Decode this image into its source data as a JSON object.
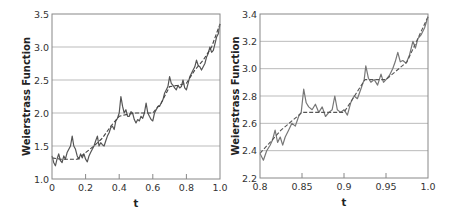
{
  "chart_data": [
    {
      "type": "line",
      "title": "",
      "xlabel": "t",
      "ylabel": "Weierstrass Function",
      "xlim": [
        0,
        1.0
      ],
      "ylim": [
        1.0,
        3.5
      ],
      "xticks": [
        0,
        0.2,
        0.4,
        0.6,
        0.8,
        1.0
      ],
      "xtick_labels": [
        "0",
        "0.2",
        "0.4",
        "0.6",
        "0.8",
        "1.0"
      ],
      "yticks": [
        1.0,
        1.5,
        2.0,
        2.5,
        3.0,
        3.5
      ],
      "ytick_labels": [
        "1.0",
        "1.5",
        "2.0",
        "2.5",
        "3.0",
        "3.5"
      ],
      "grid": "horizontal",
      "legend": null,
      "series": [
        {
          "name": "Weierstrass function",
          "style": "solid",
          "color": "#555555",
          "x": [
            0,
            0.01,
            0.02,
            0.03,
            0.04,
            0.05,
            0.06,
            0.07,
            0.08,
            0.09,
            0.1,
            0.11,
            0.12,
            0.13,
            0.14,
            0.15,
            0.16,
            0.17,
            0.18,
            0.19,
            0.2,
            0.21,
            0.22,
            0.23,
            0.24,
            0.25,
            0.26,
            0.27,
            0.28,
            0.29,
            0.3,
            0.31,
            0.32,
            0.33,
            0.34,
            0.35,
            0.36,
            0.37,
            0.38,
            0.39,
            0.4,
            0.41,
            0.42,
            0.43,
            0.44,
            0.45,
            0.46,
            0.47,
            0.48,
            0.49,
            0.5,
            0.51,
            0.52,
            0.53,
            0.54,
            0.55,
            0.56,
            0.57,
            0.58,
            0.59,
            0.6,
            0.61,
            0.62,
            0.63,
            0.64,
            0.65,
            0.66,
            0.67,
            0.68,
            0.69,
            0.7,
            0.71,
            0.72,
            0.73,
            0.74,
            0.75,
            0.76,
            0.77,
            0.78,
            0.79,
            0.8,
            0.81,
            0.82,
            0.83,
            0.84,
            0.85,
            0.86,
            0.87,
            0.88,
            0.89,
            0.9,
            0.91,
            0.92,
            0.93,
            0.94,
            0.95,
            0.96,
            0.97,
            0.98,
            0.99,
            1.0
          ],
          "y": [
            1.35,
            1.25,
            1.2,
            1.3,
            1.38,
            1.28,
            1.25,
            1.35,
            1.3,
            1.4,
            1.45,
            1.5,
            1.65,
            1.5,
            1.45,
            1.35,
            1.3,
            1.38,
            1.32,
            1.38,
            1.3,
            1.26,
            1.35,
            1.4,
            1.45,
            1.5,
            1.58,
            1.65,
            1.5,
            1.55,
            1.52,
            1.5,
            1.58,
            1.65,
            1.7,
            1.78,
            1.8,
            1.75,
            1.88,
            1.92,
            2.0,
            2.25,
            2.1,
            2.0,
            2.05,
            1.95,
            1.95,
            2.02,
            2.0,
            1.9,
            1.85,
            1.9,
            1.88,
            1.95,
            1.92,
            2.0,
            2.15,
            2.0,
            1.95,
            1.9,
            1.88,
            2.0,
            2.05,
            2.1,
            2.1,
            2.15,
            2.2,
            2.3,
            2.35,
            2.4,
            2.55,
            2.45,
            2.42,
            2.38,
            2.35,
            2.42,
            2.38,
            2.4,
            2.5,
            2.38,
            2.35,
            2.45,
            2.55,
            2.6,
            2.65,
            2.7,
            2.8,
            2.72,
            2.7,
            2.65,
            2.7,
            2.75,
            2.85,
            2.9,
            3.0,
            2.92,
            2.95,
            3.05,
            3.15,
            3.2,
            3.35
          ]
        },
        {
          "name": "Smoothed trend",
          "style": "dashed",
          "color": "#444444",
          "x": [
            0,
            0.05,
            0.1,
            0.15,
            0.2,
            0.25,
            0.3,
            0.35,
            0.4,
            0.45,
            0.5,
            0.55,
            0.6,
            0.65,
            0.7,
            0.75,
            0.8,
            0.85,
            0.9,
            0.95,
            1.0
          ],
          "y": [
            1.32,
            1.3,
            1.3,
            1.3,
            1.4,
            1.5,
            1.62,
            1.8,
            1.95,
            1.98,
            2.0,
            2.0,
            2.0,
            2.15,
            2.4,
            2.42,
            2.45,
            2.65,
            2.8,
            3.0,
            3.35
          ]
        }
      ]
    },
    {
      "type": "line",
      "title": "",
      "xlabel": "t",
      "ylabel": "Weierstrass Function",
      "xlim": [
        0.8,
        1.0
      ],
      "ylim": [
        2.2,
        3.4
      ],
      "xticks": [
        0.8,
        0.85,
        0.9,
        0.95,
        1.0
      ],
      "xtick_labels": [
        "0.8",
        "0.85",
        "0.9",
        "0.95",
        "1.0"
      ],
      "yticks": [
        2.2,
        2.4,
        2.6,
        2.8,
        3.0,
        3.2,
        3.4
      ],
      "ytick_labels": [
        "2.2",
        "2.4",
        "2.6",
        "2.8",
        "3.0",
        "3.2",
        "3.4"
      ],
      "grid": "horizontal",
      "legend": null,
      "series": [
        {
          "name": "Weierstrass function",
          "style": "solid",
          "color": "#777777",
          "x": [
            0.8,
            0.804,
            0.808,
            0.812,
            0.815,
            0.818,
            0.821,
            0.824,
            0.827,
            0.83,
            0.834,
            0.838,
            0.842,
            0.846,
            0.849,
            0.852,
            0.855,
            0.858,
            0.862,
            0.866,
            0.87,
            0.874,
            0.878,
            0.882,
            0.886,
            0.889,
            0.892,
            0.896,
            0.9,
            0.904,
            0.908,
            0.912,
            0.916,
            0.92,
            0.924,
            0.926,
            0.929,
            0.932,
            0.936,
            0.94,
            0.944,
            0.947,
            0.95,
            0.954,
            0.958,
            0.961,
            0.964,
            0.967,
            0.97,
            0.974,
            0.978,
            0.982,
            0.985,
            0.988,
            0.992,
            0.996,
            1.0
          ],
          "y": [
            2.38,
            2.33,
            2.4,
            2.44,
            2.48,
            2.55,
            2.46,
            2.5,
            2.44,
            2.5,
            2.55,
            2.6,
            2.58,
            2.65,
            2.68,
            2.85,
            2.75,
            2.72,
            2.7,
            2.74,
            2.68,
            2.72,
            2.65,
            2.68,
            2.7,
            2.8,
            2.7,
            2.68,
            2.7,
            2.66,
            2.75,
            2.8,
            2.78,
            2.85,
            2.92,
            3.02,
            2.93,
            2.9,
            2.92,
            2.88,
            2.96,
            2.9,
            2.92,
            2.95,
            3.0,
            3.05,
            3.12,
            3.05,
            3.06,
            3.04,
            3.1,
            3.2,
            3.15,
            3.22,
            3.25,
            3.3,
            3.38
          ]
        },
        {
          "name": "Smoothed trend",
          "style": "dashed",
          "color": "#555555",
          "x": [
            0.8,
            0.825,
            0.85,
            0.875,
            0.9,
            0.925,
            0.95,
            0.975,
            1.0
          ],
          "y": [
            2.38,
            2.55,
            2.68,
            2.68,
            2.68,
            2.92,
            2.92,
            3.05,
            3.38
          ]
        }
      ]
    }
  ],
  "panels": [
    {
      "ylabel": "Weierstrass Function",
      "xlabel": "t"
    },
    {
      "ylabel": "Weierstrass Function",
      "xlabel": "t"
    }
  ],
  "colors": {
    "grid": "#bbbbbb",
    "frame": "#888888",
    "text": "#333333"
  }
}
